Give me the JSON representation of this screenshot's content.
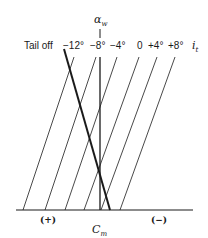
{
  "diagram": {
    "axis_top_label": "α",
    "axis_top_sub": "w",
    "x_axis_label": "C",
    "x_axis_sub": "m",
    "positive_label": "(+)",
    "negative_label": "(−)",
    "tail_off_label": "Tail off",
    "it_label": "i",
    "it_sub": "t",
    "incidence_labels": [
      "−12°",
      "−8°",
      "−4°",
      "0",
      "+4°",
      "+8°"
    ],
    "colors": {
      "ink": "#1a1a1a",
      "background": "#ffffff"
    }
  }
}
